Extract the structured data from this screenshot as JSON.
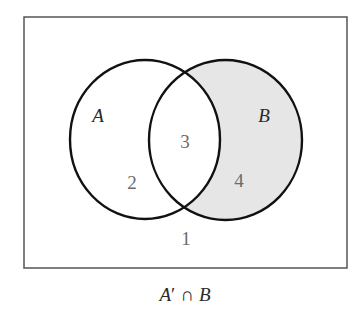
{
  "diagram": {
    "type": "venn",
    "universe": {
      "x": 24,
      "y": 17,
      "width": 323,
      "height": 251,
      "stroke": "#555555"
    },
    "sets": [
      {
        "name": "A",
        "cx": 145,
        "cy": 139.5,
        "rx": 75,
        "ry": 79.5,
        "label_x": 98,
        "label_y": 122
      },
      {
        "name": "B",
        "cx": 225.5,
        "cy": 140,
        "rx": 76.5,
        "ry": 80,
        "label_x": 264,
        "label_y": 122
      }
    ],
    "regions": [
      {
        "id": "1",
        "label": "1",
        "description": "outside A and B",
        "x": 186,
        "y": 245
      },
      {
        "id": "2",
        "label": "2",
        "description": "A only",
        "x": 132,
        "y": 189
      },
      {
        "id": "3",
        "label": "3",
        "description": "A and B",
        "x": 185,
        "y": 148
      },
      {
        "id": "4",
        "label": "4",
        "description": "B only",
        "x": 239,
        "y": 187
      }
    ],
    "shaded_region": "4",
    "shade_color": "#e6e6e6",
    "outline_color": "#111111",
    "caption": {
      "set1": "A",
      "prime": "′",
      "operator": "∩",
      "set2": "B",
      "full": "A′ ∩ B"
    }
  }
}
